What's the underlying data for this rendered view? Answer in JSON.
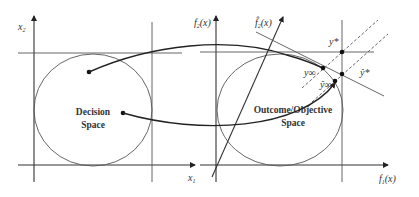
{
  "diagram": {
    "left_panel": {
      "region_label_line1": "Decision",
      "region_label_line2": "Space",
      "x_axis_label": "x",
      "x_axis_sub": "1",
      "y_axis_label": "x",
      "y_axis_sub": "2"
    },
    "right_panel": {
      "region_label_line1": "Outcome/Objective",
      "region_label_line2": "Space",
      "x_axis_label": "f",
      "x_axis_sub": "1",
      "x_axis_arg": "(x)",
      "y_axis_label": "f",
      "y_axis_sub": "2",
      "y_axis_arg": "(x)",
      "transformed_axis_label": "f̂",
      "transformed_axis_sub": "2",
      "transformed_axis_arg": "(x)",
      "points": {
        "ideal": "y*",
        "ideal_hat": "ŷ*",
        "pareto": "y∞",
        "pareto_hat": "ŷ∞"
      }
    },
    "colors": {
      "line": "#333333",
      "background": "#ffffff"
    }
  }
}
